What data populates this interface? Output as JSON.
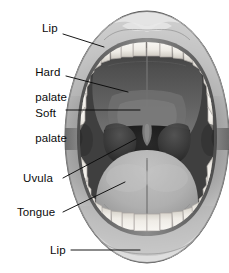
{
  "figure": {
    "style": "grayscale medical illustration",
    "width": 229,
    "height": 273,
    "background_color": "#ffffff"
  },
  "labels": [
    {
      "id": "lip-upper",
      "text": "Lip",
      "lines": [
        "Lip"
      ],
      "x": 42,
      "y": 28,
      "leader": {
        "x1": 63,
        "y1": 34,
        "x2": 104,
        "y2": 47
      },
      "target": "upper lip"
    },
    {
      "id": "hard-palate",
      "text": "Hard palate",
      "lines": [
        "Hard",
        "palate"
      ],
      "x": 22,
      "y": 59,
      "leader": {
        "x1": 66,
        "y1": 76,
        "x2": 128,
        "y2": 92
      },
      "target": "hard palate"
    },
    {
      "id": "soft-palate",
      "text": "Soft palate",
      "lines": [
        "Soft",
        "palate"
      ],
      "x": 22,
      "y": 100,
      "leader": {
        "x1": 66,
        "y1": 110,
        "x2": 140,
        "y2": 110
      },
      "target": "soft palate"
    },
    {
      "id": "uvula",
      "text": "Uvula",
      "lines": [
        "Uvula"
      ],
      "x": 23,
      "y": 173,
      "leader": {
        "x1": 63,
        "y1": 178,
        "x2": 136,
        "y2": 139
      },
      "target": "uvula"
    },
    {
      "id": "tongue",
      "text": "Tongue",
      "lines": [
        "Tongue"
      ],
      "x": 17,
      "y": 208,
      "leader": {
        "x1": 63,
        "y1": 212,
        "x2": 125,
        "y2": 182
      },
      "target": "tongue"
    },
    {
      "id": "lip-lower",
      "text": "Lip",
      "lines": [
        "Lip"
      ],
      "x": 50,
      "y": 245,
      "leader": {
        "x1": 71,
        "y1": 250,
        "x2": 140,
        "y2": 250
      },
      "target": "lower lip"
    }
  ],
  "anatomy_parts": [
    "upper lip",
    "upper teeth",
    "hard palate",
    "soft palate",
    "uvula",
    "palatine tonsil arches",
    "oropharynx",
    "tongue",
    "lower teeth",
    "lower lip"
  ],
  "colors": {
    "background": "#ffffff",
    "lip_light": "#d8d8d8",
    "lip_mid": "#9a9a9a",
    "lip_dark": "#6e6e6e",
    "teeth": "#f2f0ec",
    "teeth_shadow": "#bdb9b2",
    "palate_hard": "#5a5a5a",
    "palate_soft": "#6d6d6d",
    "throat_dark": "#191919",
    "tongue_light": "#b4b4b4",
    "tongue_mid": "#9b9b9b",
    "leader_line": "#0b0b0b",
    "label_text": "#0b0b0b"
  }
}
